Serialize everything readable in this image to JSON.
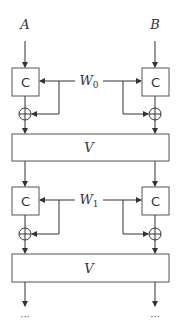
{
  "diagram": {
    "inputs": {
      "left": "A",
      "right": "B"
    },
    "rounds": [
      {
        "key": "W",
        "key_sub": "0",
        "c_left": "C",
        "c_right": "C",
        "v": "V"
      },
      {
        "key": "W",
        "key_sub": "1",
        "c_left": "C",
        "c_right": "C",
        "v": "V"
      }
    ],
    "outputs": {
      "left": "···",
      "right": "···"
    }
  }
}
